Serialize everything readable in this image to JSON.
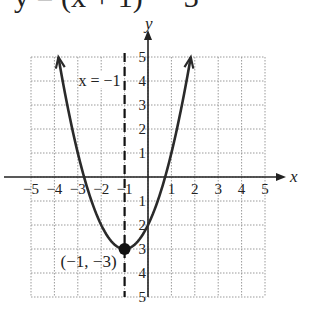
{
  "header": {
    "equation": "y = (x + 1)² − 3"
  },
  "chart_data": {
    "type": "line",
    "xlabel": "x",
    "ylabel": "y",
    "xlim": [
      -5,
      5
    ],
    "ylim": [
      -5,
      5
    ],
    "grid": true,
    "x_ticks": [
      "-5",
      "-4",
      "-3",
      "-2",
      "-1",
      "1",
      "2",
      "3",
      "4",
      "5"
    ],
    "y_ticks": [
      "5",
      "4",
      "3",
      "2",
      "1",
      "-1",
      "-2",
      "-3",
      "-4",
      "-5"
    ],
    "series": [
      {
        "name": "y = (x + 1)^2 - 3",
        "function": "(x+1)^2-3",
        "x": [
          -3.83,
          -3,
          -2,
          -1,
          0,
          1,
          1.83
        ],
        "values": [
          5,
          1,
          -2,
          -3,
          -2,
          1,
          5
        ]
      }
    ],
    "annotations": [
      {
        "text": "x = −1",
        "type": "axis_of_symmetry",
        "x": -1
      },
      {
        "text": "(−1, −3)",
        "type": "vertex",
        "x": -1,
        "y": -3
      }
    ],
    "colors": {
      "curve": "#2a2a2a",
      "grid": "#9a9a9a",
      "axes": "#222222"
    }
  }
}
